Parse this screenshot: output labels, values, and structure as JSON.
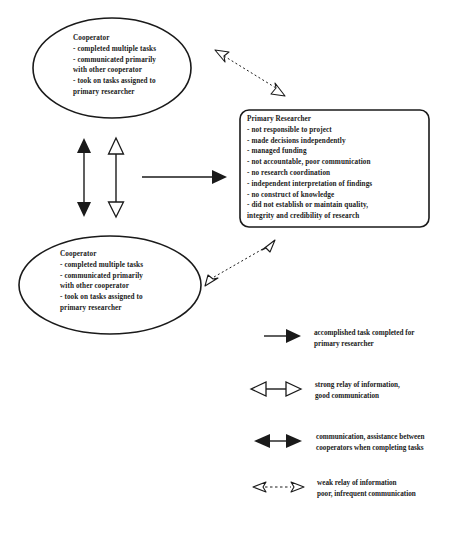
{
  "diagram": {
    "cooperator_top": {
      "title": "Cooperator",
      "lines": [
        "- completed multiple tasks",
        "-  communicated primarily",
        "with other cooperator",
        "- took on tasks assigned to",
        "primary researcher"
      ]
    },
    "cooperator_bottom": {
      "title": "Cooperator",
      "lines": [
        "- completed multiple tasks",
        "-  communicated primarily",
        "with other cooperator",
        "- took on tasks assigned to",
        "primary researcher"
      ]
    },
    "primary_researcher": {
      "title": "Primary Researcher",
      "lines": [
        "- not responsible to project",
        "- made decisions independently",
        "- managed funding",
        "- not accountable, poor communication",
        "- no research coordination",
        "- independent interpretation of findings",
        "- no construct of knowledge",
        "- did not establish or maintain quality,",
        "integrity and credibility of research"
      ]
    }
  },
  "legend": {
    "items": [
      {
        "icon": "solid-arrow-right",
        "lines": [
          "accomplished task completed for",
          "primary researcher"
        ]
      },
      {
        "icon": "hollow-double-arrow",
        "lines": [
          "strong relay of information,",
          "good communication"
        ]
      },
      {
        "icon": "solid-double-arrow",
        "lines": [
          "communication, assistance between",
          "cooperators when completing tasks"
        ]
      },
      {
        "icon": "dashed-hollow-double-arrow",
        "lines": [
          "weak relay of information",
          "poor, infrequent communication"
        ]
      }
    ]
  },
  "colors": {
    "stroke": "#1a1a1a",
    "background": "#ffffff"
  }
}
